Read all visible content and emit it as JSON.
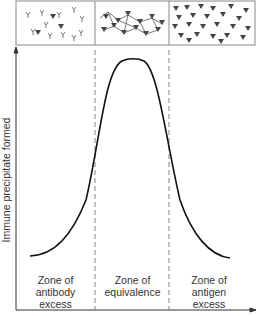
{
  "diagram": {
    "type": "precipitin-curve",
    "y_axis_label": "Immune precipitate formed",
    "zones": [
      {
        "label_l1": "Zone of",
        "label_l2": "antibody",
        "label_l3": "excess"
      },
      {
        "label_l1": "Zone of",
        "label_l2": "equivalence",
        "label_l3": ""
      },
      {
        "label_l1": "Zone of",
        "label_l2": "antigen",
        "label_l3": "excess"
      }
    ],
    "panels": [
      "antibody-excess-complexes",
      "equivalence-lattice",
      "antigen-excess-complexes"
    ],
    "colors": {
      "line": "#111111",
      "dash": "#777777",
      "frame": "#888888",
      "antigen": "#444444"
    }
  }
}
